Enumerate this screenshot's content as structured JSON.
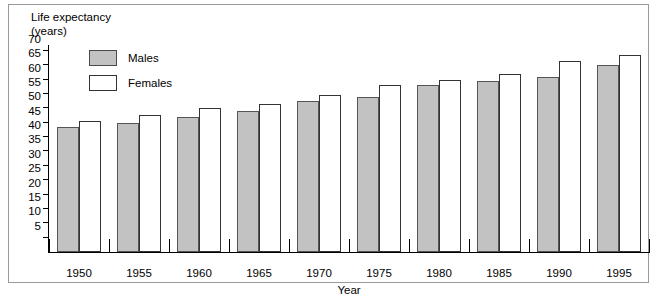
{
  "chart_data": {
    "type": "bar",
    "title": "Life expectancy\n(years)",
    "ylabel": "Life expectancy (years)",
    "xlabel": "Year",
    "categories": [
      "1950",
      "1955",
      "1960",
      "1965",
      "1970",
      "1975",
      "1980",
      "1985",
      "1990",
      "1995"
    ],
    "series": [
      {
        "name": "Males",
        "color": "#c2c2c2",
        "values": [
          43.5,
          45,
          47,
          49,
          52.5,
          54,
          58,
          59.5,
          61,
          65
        ]
      },
      {
        "name": "Females",
        "color": "#ffffff",
        "values": [
          45.5,
          47.5,
          50,
          51.5,
          54.5,
          58,
          60,
          62,
          66.5,
          68.5
        ]
      }
    ],
    "ylim": [
      0,
      72
    ],
    "yticks": [
      5,
      10,
      15,
      20,
      25,
      30,
      35,
      40,
      45,
      50,
      55,
      60,
      65,
      70
    ],
    "grid": false,
    "legend_position": "top-left"
  },
  "legend": {
    "items": [
      {
        "label": "Males"
      },
      {
        "label": "Females"
      }
    ]
  },
  "axes": {
    "y_title": "Life expectancy\n(years)",
    "x_title": "Year"
  }
}
